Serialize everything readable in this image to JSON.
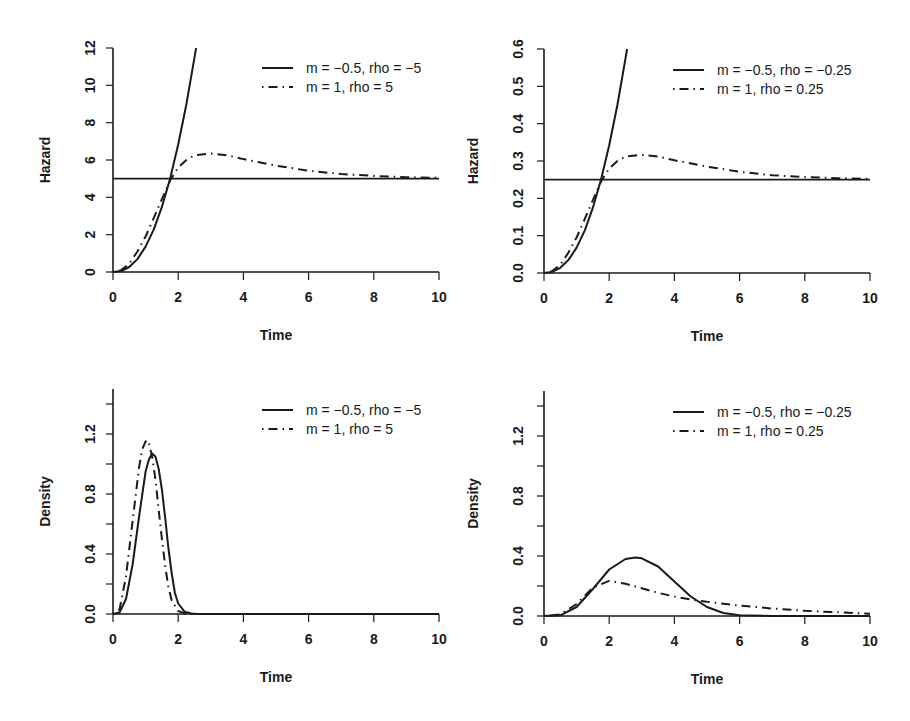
{
  "chart_data": [
    {
      "type": "line",
      "panel": "top-left",
      "title": "",
      "xlabel": "Time",
      "ylabel": "Hazard",
      "xlim": [
        0,
        10
      ],
      "ylim": [
        0,
        12
      ],
      "xticks": [
        0,
        2,
        4,
        6,
        8,
        10
      ],
      "yticks": [
        0,
        2,
        4,
        6,
        8,
        10,
        12
      ],
      "grid": false,
      "legend_position": "top-right",
      "reference_lines": [
        5
      ],
      "series": [
        {
          "name": "m = −0.5, rho = −5",
          "style": "solid",
          "x": [
            0,
            0.25,
            0.5,
            0.75,
            1.0,
            1.25,
            1.5,
            1.75,
            2.0,
            2.25,
            2.5,
            2.55
          ],
          "y": [
            0,
            0.05,
            0.27,
            0.69,
            1.36,
            2.28,
            3.49,
            5.0,
            6.83,
            8.99,
            11.5,
            12.0
          ]
        },
        {
          "name": "m = 1, rho = 5",
          "style": "dashdot",
          "x": [
            0,
            0.25,
            0.5,
            0.75,
            1.0,
            1.25,
            1.5,
            1.75,
            2.0,
            2.25,
            2.5,
            3.0,
            3.5,
            4.0,
            5.0,
            6.0,
            7.0,
            8.0,
            9.0,
            10.0
          ],
          "y": [
            0,
            0.1,
            0.45,
            1.1,
            1.9,
            2.9,
            3.9,
            4.9,
            5.6,
            6.0,
            6.25,
            6.35,
            6.25,
            6.05,
            5.7,
            5.42,
            5.25,
            5.15,
            5.08,
            5.04
          ]
        }
      ]
    },
    {
      "type": "line",
      "panel": "top-right",
      "title": "",
      "xlabel": "Time",
      "ylabel": "Hazard",
      "xlim": [
        0,
        10
      ],
      "ylim": [
        0,
        0.6
      ],
      "xticks": [
        0,
        2,
        4,
        6,
        8,
        10
      ],
      "yticks": [
        0.0,
        0.1,
        0.2,
        0.3,
        0.4,
        0.5,
        0.6
      ],
      "grid": false,
      "legend_position": "top-right",
      "reference_lines": [
        0.25
      ],
      "series": [
        {
          "name": "m = −0.5, rho = −0.25",
          "style": "solid",
          "x": [
            0,
            0.25,
            0.5,
            0.75,
            1.0,
            1.25,
            1.5,
            1.75,
            2.0,
            2.25,
            2.5,
            2.55
          ],
          "y": [
            0,
            0.003,
            0.014,
            0.035,
            0.068,
            0.114,
            0.175,
            0.25,
            0.342,
            0.45,
            0.575,
            0.6
          ]
        },
        {
          "name": "m = 1, rho = 0.25",
          "style": "dashdot",
          "x": [
            0,
            0.25,
            0.5,
            0.75,
            1.0,
            1.25,
            1.5,
            1.75,
            2.0,
            2.25,
            2.5,
            3.0,
            3.5,
            4.0,
            5.0,
            6.0,
            7.0,
            8.0,
            9.0,
            10.0
          ],
          "y": [
            0,
            0.005,
            0.022,
            0.055,
            0.095,
            0.145,
            0.195,
            0.245,
            0.28,
            0.3,
            0.312,
            0.317,
            0.312,
            0.302,
            0.285,
            0.271,
            0.262,
            0.257,
            0.254,
            0.252
          ]
        }
      ]
    },
    {
      "type": "line",
      "panel": "bottom-left",
      "title": "",
      "xlabel": "Time",
      "ylabel": "Density",
      "xlim": [
        0,
        10
      ],
      "ylim": [
        0,
        1.5
      ],
      "xticks": [
        0,
        2,
        4,
        6,
        8,
        10
      ],
      "yticks": [
        0.0,
        0.2,
        0.4,
        0.6,
        0.8,
        1.0,
        1.2,
        1.4
      ],
      "yticklabels": [
        "0.0",
        "",
        "0.4",
        "",
        "0.8",
        "",
        "1.2",
        ""
      ],
      "grid": false,
      "legend_position": "top-right",
      "series": [
        {
          "name": "m = −0.5, rho = −5",
          "style": "solid",
          "x": [
            0,
            0.2,
            0.4,
            0.6,
            0.8,
            1.0,
            1.1,
            1.2,
            1.3,
            1.4,
            1.5,
            1.6,
            1.7,
            1.8,
            1.9,
            2.0,
            2.2,
            2.4,
            2.6,
            3.0,
            10.0
          ],
          "y": [
            0,
            0.01,
            0.1,
            0.33,
            0.65,
            0.95,
            1.03,
            1.07,
            1.05,
            0.97,
            0.83,
            0.64,
            0.44,
            0.27,
            0.14,
            0.07,
            0.015,
            0.003,
            0.0,
            0.0,
            0.0
          ]
        },
        {
          "name": "m = 1, rho = 5",
          "style": "dashdot",
          "x": [
            0,
            0.2,
            0.4,
            0.6,
            0.8,
            0.9,
            1.0,
            1.05,
            1.1,
            1.2,
            1.3,
            1.4,
            1.5,
            1.6,
            1.7,
            1.8,
            2.0,
            2.2,
            2.5,
            10.0
          ],
          "y": [
            0,
            0.03,
            0.25,
            0.62,
            0.98,
            1.1,
            1.15,
            1.16,
            1.14,
            1.05,
            0.9,
            0.7,
            0.5,
            0.32,
            0.18,
            0.09,
            0.02,
            0.004,
            0.0,
            0.0
          ]
        }
      ]
    },
    {
      "type": "line",
      "panel": "bottom-right",
      "title": "",
      "xlabel": "Time",
      "ylabel": "Density",
      "xlim": [
        0,
        10
      ],
      "ylim": [
        0,
        1.5
      ],
      "xticks": [
        0,
        2,
        4,
        6,
        8,
        10
      ],
      "yticks": [
        0.0,
        0.2,
        0.4,
        0.6,
        0.8,
        1.0,
        1.2,
        1.4
      ],
      "yticklabels": [
        "0.0",
        "",
        "0.4",
        "",
        "0.8",
        "",
        "1.2",
        ""
      ],
      "grid": false,
      "legend_position": "top-right",
      "series": [
        {
          "name": "m = −0.5, rho = −0.25",
          "style": "solid",
          "x": [
            0,
            0.5,
            1.0,
            1.5,
            2.0,
            2.5,
            2.8,
            3.0,
            3.5,
            4.0,
            4.5,
            5.0,
            5.5,
            6.0,
            7.0,
            10.0
          ],
          "y": [
            0,
            0.005,
            0.06,
            0.18,
            0.31,
            0.38,
            0.39,
            0.385,
            0.33,
            0.23,
            0.13,
            0.06,
            0.02,
            0.005,
            0.0,
            0.0
          ]
        },
        {
          "name": "m = 1, rho = 0.25",
          "style": "dashdot",
          "x": [
            0,
            0.5,
            1.0,
            1.5,
            2.0,
            2.5,
            3.0,
            3.5,
            4.0,
            4.5,
            5.0,
            6.0,
            7.0,
            8.0,
            9.0,
            10.0
          ],
          "y": [
            0,
            0.01,
            0.08,
            0.19,
            0.235,
            0.215,
            0.185,
            0.155,
            0.13,
            0.11,
            0.095,
            0.07,
            0.05,
            0.035,
            0.025,
            0.015
          ]
        }
      ]
    }
  ]
}
